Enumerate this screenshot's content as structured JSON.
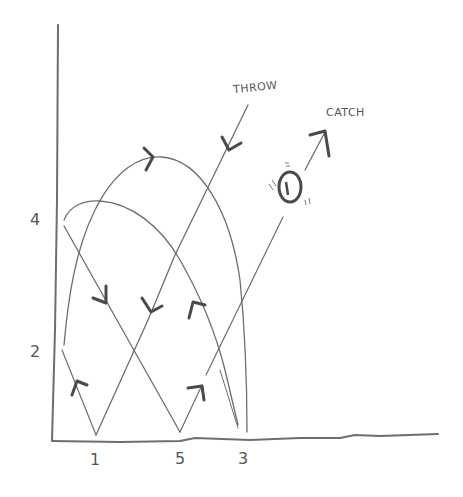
{
  "diagram": {
    "type": "juggling-ladder-diagram",
    "annotations": {
      "throw": "THROW",
      "catch": "CATCH"
    },
    "y_axis": {
      "ticks": [
        "4",
        "2"
      ]
    },
    "x_axis": {
      "ticks": [
        "1",
        "5",
        "3"
      ]
    },
    "colors": {
      "stroke": "#6b6b6b",
      "arrow": "#4a4a4a",
      "background": "#ffffff"
    }
  }
}
